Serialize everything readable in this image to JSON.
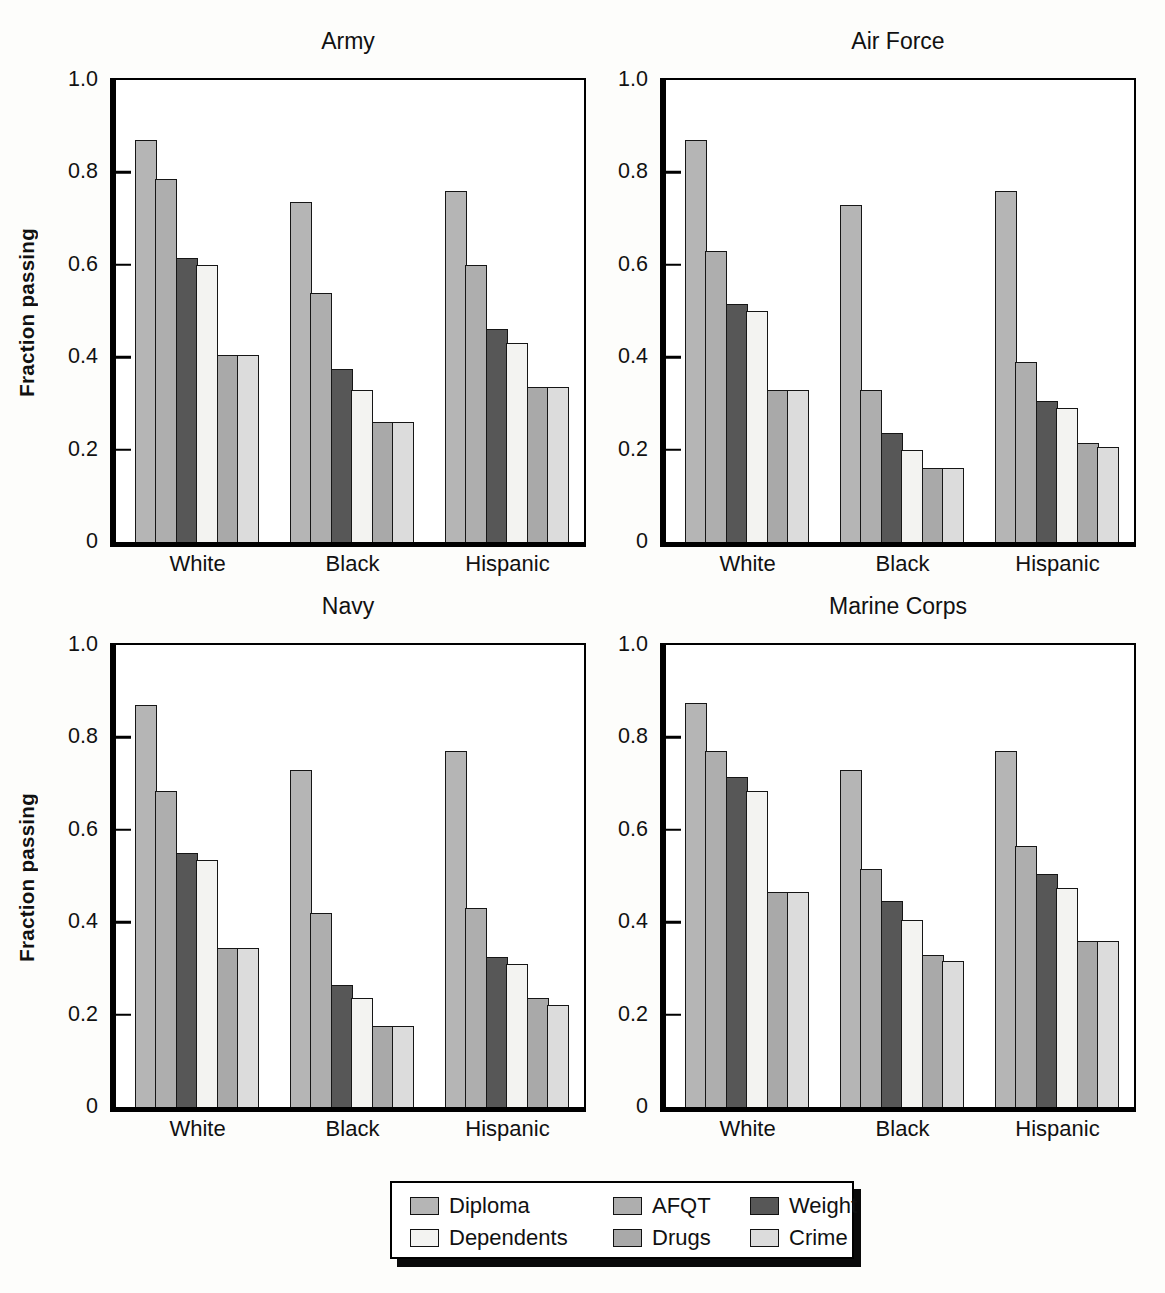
{
  "y_axis": {
    "label": "Fraction passing",
    "ticks": [
      {
        "label": "1.0",
        "value": 1.0
      },
      {
        "label": "0.8",
        "value": 0.8
      },
      {
        "label": "0.6",
        "value": 0.6
      },
      {
        "label": "0.4",
        "value": 0.4
      },
      {
        "label": "0.2",
        "value": 0.2
      },
      {
        "label": "0",
        "value": 0.0
      }
    ]
  },
  "series_meta": [
    {
      "name": "Diploma",
      "color": "#b5b5b5"
    },
    {
      "name": "AFQT",
      "color": "#aeaeae"
    },
    {
      "name": "Weight",
      "color": "#575757"
    },
    {
      "name": "Dependents",
      "color": "#f3f3f1"
    },
    {
      "name": "Drugs",
      "color": "#a9a9a9"
    },
    {
      "name": "Crime",
      "color": "#dcdcdc"
    }
  ],
  "chart_data": [
    {
      "type": "bar",
      "title": "Army",
      "xlabel": "",
      "ylabel": "Fraction passing",
      "ylim": [
        0,
        1.0
      ],
      "grid": false,
      "legend_position": "shared-bottom",
      "categories": [
        "White",
        "Black",
        "Hispanic"
      ],
      "series": [
        {
          "name": "Diploma",
          "values": [
            0.87,
            0.735,
            0.76
          ]
        },
        {
          "name": "AFQT",
          "values": [
            0.785,
            0.54,
            0.6
          ]
        },
        {
          "name": "Weight",
          "values": [
            0.615,
            0.375,
            0.46
          ]
        },
        {
          "name": "Dependents",
          "values": [
            0.6,
            0.33,
            0.43
          ]
        },
        {
          "name": "Drugs",
          "values": [
            0.405,
            0.26,
            0.335
          ]
        },
        {
          "name": "Crime",
          "values": [
            0.405,
            0.26,
            0.335
          ]
        }
      ]
    },
    {
      "type": "bar",
      "title": "Air Force",
      "xlabel": "",
      "ylabel": "Fraction passing",
      "ylim": [
        0,
        1.0
      ],
      "grid": false,
      "legend_position": "shared-bottom",
      "categories": [
        "White",
        "Black",
        "Hispanic"
      ],
      "series": [
        {
          "name": "Diploma",
          "values": [
            0.87,
            0.73,
            0.76
          ]
        },
        {
          "name": "AFQT",
          "values": [
            0.63,
            0.33,
            0.39
          ]
        },
        {
          "name": "Weight",
          "values": [
            0.515,
            0.235,
            0.305
          ]
        },
        {
          "name": "Dependents",
          "values": [
            0.5,
            0.2,
            0.29
          ]
        },
        {
          "name": "Drugs",
          "values": [
            0.33,
            0.16,
            0.215
          ]
        },
        {
          "name": "Crime",
          "values": [
            0.33,
            0.16,
            0.205
          ]
        }
      ]
    },
    {
      "type": "bar",
      "title": "Navy",
      "xlabel": "",
      "ylabel": "Fraction passing",
      "ylim": [
        0,
        1.0
      ],
      "grid": false,
      "legend_position": "shared-bottom",
      "categories": [
        "White",
        "Black",
        "Hispanic"
      ],
      "series": [
        {
          "name": "Diploma",
          "values": [
            0.87,
            0.73,
            0.77
          ]
        },
        {
          "name": "AFQT",
          "values": [
            0.685,
            0.42,
            0.43
          ]
        },
        {
          "name": "Weight",
          "values": [
            0.55,
            0.265,
            0.325
          ]
        },
        {
          "name": "Dependents",
          "values": [
            0.535,
            0.235,
            0.31
          ]
        },
        {
          "name": "Drugs",
          "values": [
            0.345,
            0.175,
            0.235
          ]
        },
        {
          "name": "Crime",
          "values": [
            0.345,
            0.175,
            0.22
          ]
        }
      ]
    },
    {
      "type": "bar",
      "title": "Marine Corps",
      "xlabel": "",
      "ylabel": "Fraction passing",
      "ylim": [
        0,
        1.0
      ],
      "grid": false,
      "legend_position": "shared-bottom",
      "categories": [
        "White",
        "Black",
        "Hispanic"
      ],
      "series": [
        {
          "name": "Diploma",
          "values": [
            0.875,
            0.73,
            0.77
          ]
        },
        {
          "name": "AFQT",
          "values": [
            0.77,
            0.515,
            0.565
          ]
        },
        {
          "name": "Weight",
          "values": [
            0.715,
            0.445,
            0.505
          ]
        },
        {
          "name": "Dependents",
          "values": [
            0.685,
            0.405,
            0.475
          ]
        },
        {
          "name": "Drugs",
          "values": [
            0.465,
            0.33,
            0.36
          ]
        },
        {
          "name": "Crime",
          "values": [
            0.465,
            0.315,
            0.36
          ]
        }
      ]
    }
  ]
}
